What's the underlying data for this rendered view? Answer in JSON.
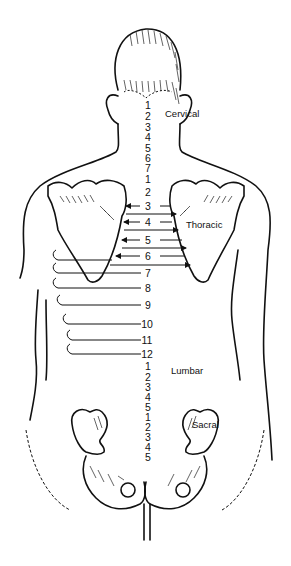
{
  "diagram": {
    "regions": {
      "cervical": "Cervical",
      "thoracic": "Thoracic",
      "lumbar": "Lumbar",
      "sacral": "Sacral"
    },
    "cervical_numbers": [
      "1",
      "2",
      "3",
      "4",
      "5",
      "6",
      "7"
    ],
    "thoracic_numbers": [
      "1",
      "2",
      "3",
      "4",
      "5",
      "6",
      "7",
      "8",
      "9",
      "10",
      "11",
      "12"
    ],
    "lumbar_numbers": [
      "1",
      "2",
      "3",
      "4",
      "5"
    ],
    "sacral_numbers": [
      "1",
      "2",
      "3",
      "4",
      "5"
    ]
  }
}
